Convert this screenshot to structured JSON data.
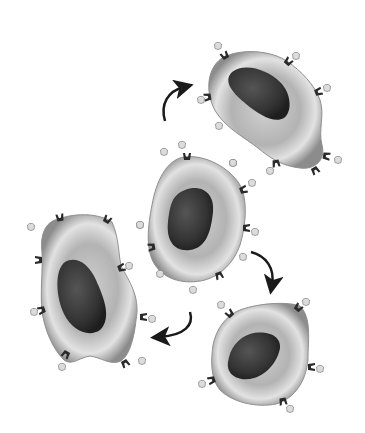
{
  "diagram": {
    "colors": {
      "background": "#ffffff",
      "cell_edge": "#8a8a8a",
      "cell_mid": "#b8b8b8",
      "cell_light": "#e4e4e4",
      "nucleus_dark": "#2e2e2e",
      "nucleus_mid": "#4a4a4a",
      "receptor": "#2a2a2a",
      "ligand": "#d9d9d9",
      "ligand_edge": "#8c8c8c",
      "arrow": "#1a1a1a"
    },
    "cells": [
      {
        "name": "cell-top-right",
        "position": "top-right"
      },
      {
        "name": "cell-center",
        "position": "center"
      },
      {
        "name": "cell-bottom-left",
        "position": "bottom-left"
      },
      {
        "name": "cell-bottom-right",
        "position": "bottom-right"
      }
    ],
    "arrows": [
      {
        "name": "arrow-center-to-top-right",
        "direction": "curved up-right"
      },
      {
        "name": "arrow-center-to-bottom-right",
        "direction": "curved down"
      },
      {
        "name": "arrow-to-bottom-left",
        "direction": "curved down-left"
      }
    ]
  }
}
